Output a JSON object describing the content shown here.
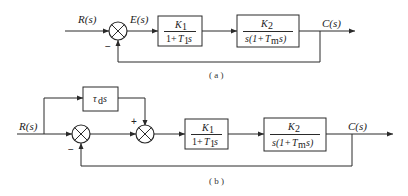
{
  "diagram_a": {
    "caption": "( a )",
    "input_label": "R(s)",
    "error_label": "E(s)",
    "output_label": "C(s)",
    "feedback_sign": "−",
    "block1": {
      "num": "K",
      "num_sub": "1",
      "den_pre": "1+",
      "den_var": "T",
      "den_sub": "1",
      "den_post": "s"
    },
    "block2": {
      "num": "K",
      "num_sub": "2",
      "den_pre": "s(1+",
      "den_var": "T",
      "den_sub": "m",
      "den_post": "s)"
    }
  },
  "diagram_b": {
    "caption": "( b )",
    "input_label": "R(s)",
    "output_label": "C(s)",
    "feedback_sign": "−",
    "feedforward_sign": "+",
    "feedforward_block": {
      "var": "τ",
      "sub": "d",
      "post": "s"
    },
    "block1": {
      "num": "K",
      "num_sub": "1",
      "den_pre": "1+",
      "den_var": "T",
      "den_sub": "1",
      "den_post": "s"
    },
    "block2": {
      "num": "K",
      "num_sub": "2",
      "den_pre": "s(1+",
      "den_var": "T",
      "den_sub": "m",
      "den_post": "s)"
    }
  }
}
